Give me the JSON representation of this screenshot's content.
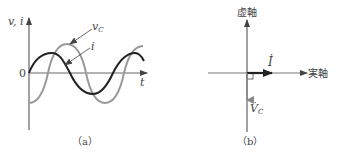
{
  "panel_a": {
    "caption": "（a）",
    "y_axis_label": "v, i",
    "x_axis_label": "t",
    "origin_label": "0",
    "curves": [
      {
        "name": "i",
        "label": "i",
        "color": "#222222",
        "phase": "starts at zero, rising (sin)"
      },
      {
        "name": "v_C",
        "label": "v",
        "subscript": "C",
        "color": "#999999",
        "phase": "lags i by 90° (-cos)"
      }
    ]
  },
  "panel_b": {
    "caption": "（b）",
    "imag_axis_label": "虚軸",
    "real_axis_label": "実軸",
    "phasors": [
      {
        "name": "I",
        "label": "İ",
        "direction": "real positive",
        "color": "#222222"
      },
      {
        "name": "V_C",
        "label": "V̇",
        "subscript": "C",
        "direction": "imaginary negative",
        "color": "#888888"
      }
    ],
    "right_angle_marker": true
  }
}
